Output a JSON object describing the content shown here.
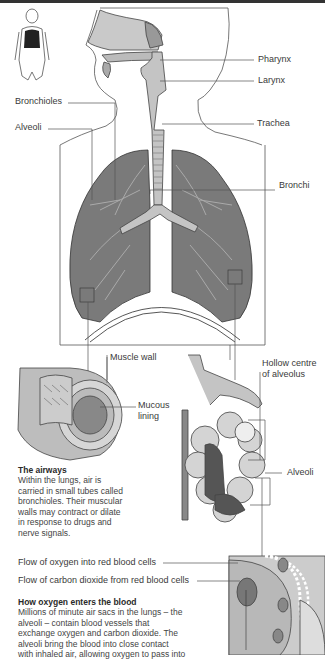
{
  "labels": {
    "pharynx": "Pharynx",
    "larynx": "Larynx",
    "trachea": "Trachea",
    "bronchi": "Bronchi",
    "bronchioles": "Bronchioles",
    "alveoli_top": "Alveoli",
    "muscle_wall": "Muscle wall",
    "mucous_lining_1": "Mucous",
    "mucous_lining_2": "lining",
    "hollow_centre_1": "Hollow centre",
    "hollow_centre_2": "of alveolus",
    "alveoli_cluster": "Alveoli",
    "flow_oxygen": "Flow of oxygen into red blood cells",
    "flow_co2": "Flow of carbon dioxide from red blood cells"
  },
  "airways": {
    "title": "The airways",
    "lines": [
      "Within the lungs, air is",
      "carried in small tubes called",
      "bronchioles. Their muscular",
      "walls may contract or dilate",
      "in response to drugs and",
      "nerve signals."
    ]
  },
  "oxygen": {
    "title": "How oxygen enters the blood",
    "lines": [
      "Millions of minute air sacs in the lungs – the",
      "alveoli – contain blood vessels that",
      "exchange oxygen and carbon dioxide. The",
      "alveoli bring the blood into close contact",
      "with inhaled air, allowing oxygen to pass into"
    ]
  },
  "colors": {
    "lung": "#7a7a7a",
    "lung_dark": "#555555",
    "line": "#555555",
    "tissue": "#bdbdbd"
  }
}
